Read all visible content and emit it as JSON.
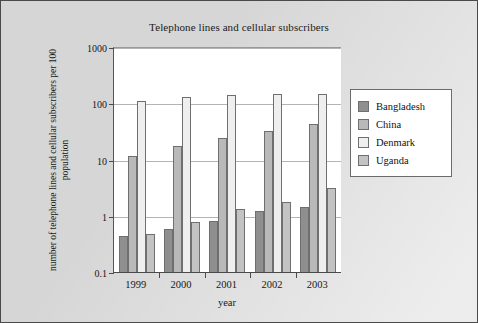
{
  "figure": {
    "background_color": "#d6d6d6",
    "plot_background_color": "#ffffff",
    "border_color": "#4a4a4a"
  },
  "chart_data": {
    "type": "bar",
    "title": "Telephone lines and cellular subscribers",
    "xlabel": "year",
    "ylabel": "number of telephone lines and cellular subscribers per 100 population",
    "categories": [
      "1999",
      "2000",
      "2001",
      "2002",
      "2003"
    ],
    "yscale": "log",
    "ylim": [
      0.1,
      1000
    ],
    "yticks": [
      0.1,
      1,
      10,
      100,
      1000
    ],
    "ytick_labels": [
      "0.1",
      "1",
      "10",
      "100",
      "1000"
    ],
    "grid": true,
    "legend_position": "right",
    "series": [
      {
        "name": "Bangladesh",
        "color": "#8f8f8f",
        "values": [
          0.45,
          0.6,
          0.85,
          1.25,
          1.5
        ]
      },
      {
        "name": "China",
        "color": "#b9b9b9",
        "values": [
          12,
          18,
          25,
          33,
          45
        ]
      },
      {
        "name": "Denmark",
        "color": "#efefef",
        "values": [
          115,
          133,
          148,
          153,
          152
        ]
      },
      {
        "name": "Uganda",
        "color": "#c3c3c3",
        "values": [
          0.5,
          0.82,
          1.4,
          1.8,
          3.2
        ]
      }
    ]
  }
}
